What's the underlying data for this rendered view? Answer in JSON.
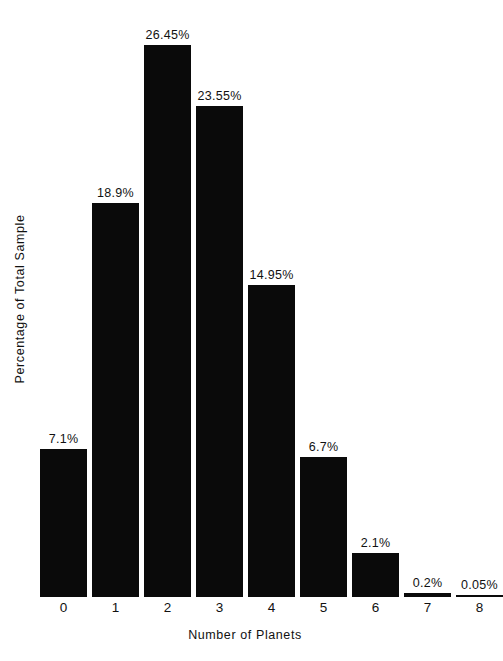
{
  "chart_data": {
    "type": "bar",
    "title": "",
    "xlabel": "Number of Planets",
    "ylabel": "Percentage of Total Sample",
    "categories": [
      "0",
      "1",
      "2",
      "3",
      "4",
      "5",
      "6",
      "7",
      "8"
    ],
    "values": [
      7.1,
      18.9,
      26.45,
      23.55,
      14.95,
      6.7,
      2.1,
      0.2,
      0.05
    ],
    "value_labels": [
      "7.1%",
      "18.9%",
      "26.45%",
      "23.55%",
      "14.95%",
      "6.7%",
      "2.1%",
      "0.2%",
      "0.05%"
    ],
    "ylim": [
      0,
      26.45
    ],
    "grid": false,
    "legend": false,
    "bar_color": "#0a0a0a",
    "background_color": "#ffffff"
  }
}
